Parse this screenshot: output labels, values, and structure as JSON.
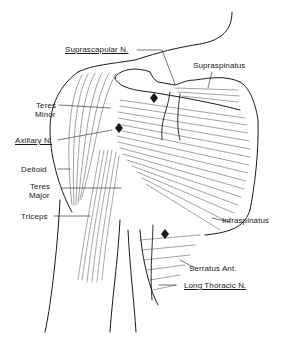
{
  "figure": {
    "type": "anatomical-illustration",
    "labels": {
      "suprascapular_n": "Suprascapular N.",
      "supraspinatus": "Supraspinatus",
      "teres_minor_1": "Teres",
      "teres_minor_2": "Minor",
      "axillary_n": "Axillary N.",
      "deltoid": "Deltoid",
      "teres_major_1": "Teres",
      "teres_major_2": "Major",
      "triceps": "Triceps",
      "infraspinatus": "Infraspinatus",
      "serratus_ant": "Serratus Ant.",
      "long_thoracic_n": "Long Thoracic N."
    },
    "underlined_labels": [
      "Suprascapular N.",
      "Axillary N.",
      "Long Thoracic N."
    ],
    "colors": {
      "ink": "#1a1a1a",
      "background": "#ffffff"
    }
  }
}
